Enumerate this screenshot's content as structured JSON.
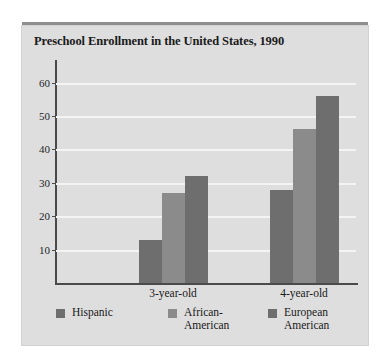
{
  "figure": {
    "title": "Preschool Enrollment in the United States, 1990",
    "panel_color": "#dedede",
    "rule_color": "#8e8e8e",
    "gridline_color": "#f4f4f4",
    "axis_color": "#4a4a4a"
  },
  "chart_data": {
    "type": "bar",
    "title": "Preschool Enrollment in the United States, 1990",
    "xlabel": "",
    "ylabel": "",
    "categories": [
      "3-year-old",
      "4-year-old"
    ],
    "series": [
      {
        "name": "Hispanic",
        "label": "Hispanic",
        "color": "#6e6e6e",
        "values": [
          13,
          28
        ]
      },
      {
        "name": "African-American",
        "label": "African-\nAmerican",
        "color": "#8b8b8b",
        "values": [
          27,
          46
        ]
      },
      {
        "name": "European American",
        "label": "European\nAmerican",
        "color": "#6e6e6e",
        "values": [
          32,
          56
        ]
      }
    ],
    "ylim": [
      0,
      65
    ],
    "yticks": [
      10,
      20,
      30,
      40,
      50,
      60
    ],
    "ytick_labels": [
      "10",
      "20",
      "30",
      "40",
      "50",
      "60"
    ],
    "grid": true,
    "legend_position": "bottom"
  }
}
